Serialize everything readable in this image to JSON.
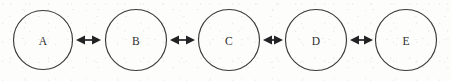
{
  "diagram": {
    "type": "node-link-chain",
    "orientation": "horizontal",
    "background_color": "#fdfdfc",
    "stroke_color": "#3a3a3c",
    "arrow_color": "#232325",
    "label_color": "#2e2e30",
    "node_radius": 29.5,
    "node_center_y": 40,
    "nodes": [
      {
        "id": "node-a",
        "label": "A",
        "cx": 43,
        "cy": 40,
        "r": 29.5
      },
      {
        "id": "node-b",
        "label": "B",
        "cx": 136,
        "cy": 40,
        "r": 30.5
      },
      {
        "id": "node-c",
        "label": "C",
        "cx": 229,
        "cy": 40,
        "r": 30.5
      },
      {
        "id": "node-d",
        "label": "D",
        "cx": 316,
        "cy": 40,
        "r": 30.5
      },
      {
        "id": "node-e",
        "label": "E",
        "cx": 406,
        "cy": 40,
        "r": 30.5
      }
    ],
    "links": [
      {
        "id": "link-a-b",
        "from": "A",
        "to": "B",
        "label": "",
        "arrow": "double",
        "x1": 76,
        "x2": 101,
        "y": 40
      },
      {
        "id": "link-b-c",
        "from": "B",
        "to": "C",
        "label": "",
        "arrow": "double",
        "x1": 170,
        "x2": 195,
        "y": 40
      },
      {
        "id": "link-c-d",
        "from": "C",
        "to": "D",
        "label": "",
        "arrow": "double",
        "x1": 263,
        "x2": 283,
        "y": 40
      },
      {
        "id": "link-d-e",
        "from": "D",
        "to": "E",
        "label": "",
        "arrow": "double",
        "x1": 350,
        "x2": 373,
        "y": 40
      }
    ]
  }
}
